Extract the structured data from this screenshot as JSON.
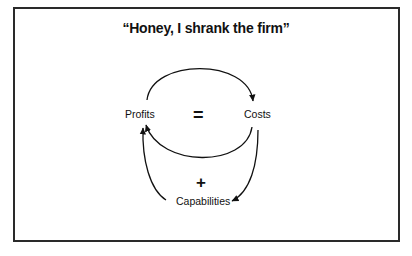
{
  "diagram": {
    "title": "“Honey, I shrank the firm”",
    "nodes": [
      {
        "id": "profits",
        "label": "Profits"
      },
      {
        "id": "costs",
        "label": "Costs"
      },
      {
        "id": "capabilities",
        "label": "Capabilities"
      }
    ],
    "loop_signs": {
      "inner_loop": "=",
      "outer_loop": "+"
    },
    "edges": [
      {
        "from": "profits",
        "to": "costs",
        "path": "top-arc"
      },
      {
        "from": "costs",
        "to": "profits",
        "path": "inner-lower-arc"
      },
      {
        "from": "costs",
        "to": "capabilities",
        "path": "right-curve"
      },
      {
        "from": "capabilities",
        "to": "profits",
        "path": "left-curve"
      }
    ],
    "colors": {
      "line": "#111111",
      "border": "#2a2a2a",
      "background": "#ffffff"
    }
  }
}
